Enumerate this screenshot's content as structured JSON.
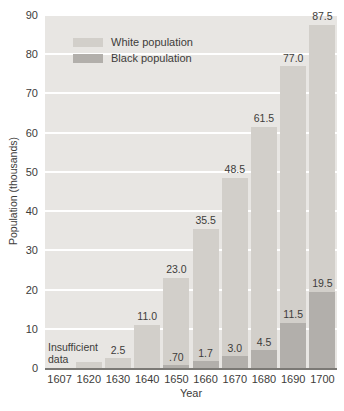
{
  "figure": {
    "background": "#ffffff",
    "plot_bg": "#e8e6e3",
    "grid_color": "#ffffff",
    "axis_line_color": "#7b7975",
    "text_color": "#3d3c3a"
  },
  "chart_data": {
    "type": "bar",
    "bar_style": "overlapping",
    "title": "",
    "xlabel": "Year",
    "ylabel": "Population (thousands)",
    "ylim": [
      0,
      90
    ],
    "ytick_interval": 10,
    "yticks": [
      0,
      10,
      20,
      30,
      40,
      50,
      60,
      70,
      80,
      90
    ],
    "categories": [
      "1607",
      "1620",
      "1630",
      "1640",
      "1650",
      "1660",
      "1670",
      "1680",
      "1690",
      "1700"
    ],
    "series": [
      {
        "name": "White population",
        "color": "#d2cfca",
        "values": [
          null,
          1.5,
          2.5,
          11.0,
          23.0,
          35.5,
          48.5,
          61.5,
          77.0,
          87.5
        ],
        "labels": [
          "",
          "",
          "2.5",
          "11.0",
          "23.0",
          "35.5",
          "48.5",
          "61.5",
          "77.0",
          "87.5"
        ]
      },
      {
        "name": "Black population",
        "color": "#b2afab",
        "values": [
          null,
          null,
          null,
          null,
          0.7,
          1.7,
          3.0,
          4.5,
          11.5,
          19.5
        ],
        "labels": [
          "",
          "",
          "",
          "",
          ".70",
          "1.7",
          "3.0",
          "4.5",
          "11.5",
          "19.5"
        ]
      }
    ],
    "annotations": [
      {
        "text": "Insufficient data",
        "target_category": "1607"
      }
    ],
    "legend": {
      "position": "top-left",
      "entries": [
        "White population",
        "Black population"
      ]
    },
    "grid": true
  }
}
